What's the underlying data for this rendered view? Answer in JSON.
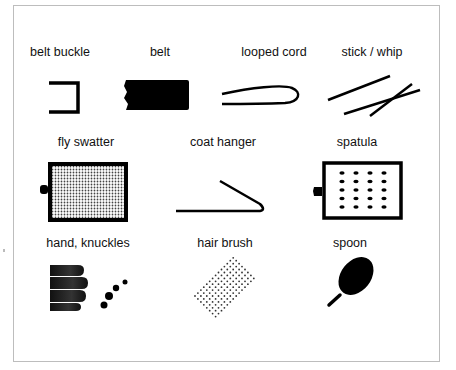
{
  "figure": {
    "type": "instrument-illustration-grid",
    "items": [
      {
        "id": "belt-buckle",
        "label": "belt buckle"
      },
      {
        "id": "belt",
        "label": "belt"
      },
      {
        "id": "looped-cord",
        "label": "looped cord"
      },
      {
        "id": "stick-whip",
        "label": "stick / whip"
      },
      {
        "id": "fly-swatter",
        "label": "fly swatter"
      },
      {
        "id": "coat-hanger",
        "label": "coat hanger"
      },
      {
        "id": "spatula",
        "label": "spatula"
      },
      {
        "id": "hand-knuckles",
        "label": "hand, knuckles"
      },
      {
        "id": "hair-brush",
        "label": "hair brush"
      },
      {
        "id": "spoon",
        "label": "spoon"
      }
    ],
    "colors": {
      "ink": "#000000",
      "border": "#bdbdbd",
      "background": "#ffffff"
    }
  }
}
